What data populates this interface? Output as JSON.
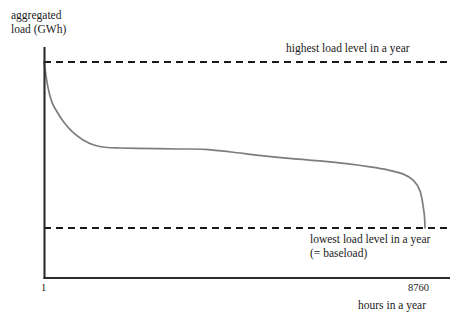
{
  "chart_data": {
    "type": "line",
    "title": "",
    "subtitle": "",
    "ylabel_line1": "aggregated",
    "ylabel_line2": "load (GWh)",
    "xlabel": "hours in a year",
    "xticks": [
      "1",
      "8760"
    ],
    "xlim": [
      1,
      8760
    ],
    "grid": false,
    "legend_position": "none",
    "series": [
      {
        "name": "load duration curve",
        "color": "#7d7d7d",
        "x": [
          1,
          90,
          180,
          300,
          450,
          650,
          900,
          1150,
          1450,
          1750,
          2150,
          2600,
          3100,
          3700,
          4300,
          5000,
          5700,
          6400,
          7000,
          7500,
          7900,
          8250,
          8500,
          8650,
          8740,
          8760
        ],
        "y": [
          100,
          85,
          76,
          70,
          64,
          58,
          53,
          50,
          48.5,
          48.2,
          48.0,
          47.8,
          47.6,
          47.4,
          45.8,
          43.6,
          41.8,
          40.3,
          38.6,
          36.8,
          35.0,
          32.6,
          28.5,
          22.0,
          9.0,
          0
        ]
      }
    ],
    "reference_lines": [
      {
        "name": "highest-load-level",
        "value": 100,
        "style": "dashed",
        "color": "#1a1a1a",
        "label": "highest load level in a year"
      },
      {
        "name": "lowest-load-level",
        "value": 0,
        "style": "dashed",
        "color": "#1a1a1a",
        "label_line1": "lowest load level in a year",
        "label_line2": "(= baseload)"
      }
    ],
    "annotations": [
      "highest load level in a year",
      "lowest load level in a year",
      "(= baseload)"
    ],
    "colors": {
      "curve": "#7d7d7d",
      "axis": "#2b2b2b",
      "dashed": "#1a1a1a",
      "background": "#ffffff"
    }
  }
}
